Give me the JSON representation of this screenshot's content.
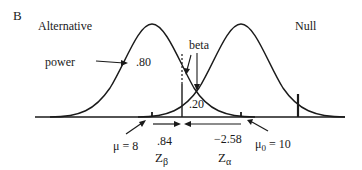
{
  "panel_label": "B",
  "curves": {
    "alternative": {
      "label": "Alternative",
      "mean_label": "μ = 8"
    },
    "null": {
      "label": "Null",
      "mean_label_main": "μ",
      "mean_label_sub": "0",
      "mean_label_rest": " = 10"
    }
  },
  "annotations": {
    "power_label": "power",
    "power_value": ".80",
    "beta_label": "beta",
    "beta_value": ".20",
    "z_beta_value": ".84",
    "z_beta_symbol": "Z",
    "z_beta_sub": "β",
    "z_alpha_value": "−2.58",
    "z_alpha_symbol": "Z",
    "z_alpha_sub": "α"
  },
  "colors": {
    "ink": "#1a1a1a",
    "background": "#ffffff"
  }
}
